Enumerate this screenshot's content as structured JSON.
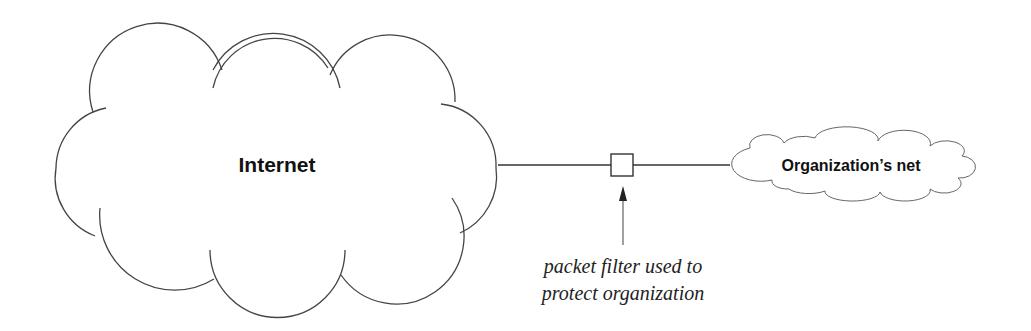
{
  "diagram": {
    "internet_cloud": {
      "label": "Internet"
    },
    "org_cloud": {
      "label": "Organization’s net"
    },
    "filter_box": {
      "name": "packet filter"
    },
    "annotation": {
      "line1": "packet filter used to",
      "line2": "protect organization"
    },
    "colors": {
      "stroke": "#333333",
      "background": "#ffffff",
      "text": "#111111"
    }
  }
}
